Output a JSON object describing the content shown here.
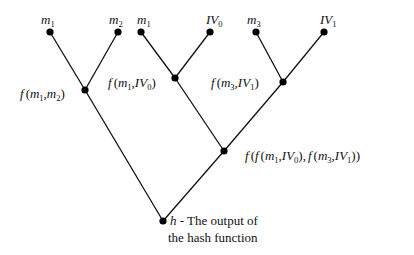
{
  "diagram": {
    "colors": {
      "line": "#111111",
      "node": "#000000",
      "background": "#ffffff"
    },
    "leaves": [
      {
        "id": "leaf-m1-a",
        "var": "m",
        "sub": "1"
      },
      {
        "id": "leaf-m2",
        "var": "m",
        "sub": "2"
      },
      {
        "id": "leaf-m1-b",
        "var": "m",
        "sub": "1"
      },
      {
        "id": "leaf-iv0",
        "var": "IV",
        "sub": "0"
      },
      {
        "id": "leaf-m3",
        "var": "m",
        "sub": "3"
      },
      {
        "id": "leaf-iv1",
        "var": "IV",
        "sub": "1"
      }
    ],
    "internal": {
      "f_m1_m2": "f(m1, m2)",
      "f_m1_iv0": "f(m1, IV0)",
      "f_m3_iv1": "f(m3, IV1)",
      "f_combined": "f(f(m1, IV0), f(m3, IV1))"
    },
    "labels": {
      "f": "f",
      "open": "(",
      "close": ")",
      "comma": ",",
      "m": "m",
      "IV": "IV",
      "s1": "1",
      "s2": "2",
      "s3": "3",
      "s0": "0",
      "h": "h",
      "root_line1": " - The output of",
      "root_line2": "the hash function"
    }
  }
}
